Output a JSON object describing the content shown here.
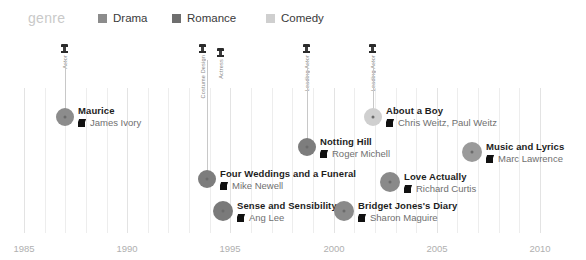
{
  "legend": {
    "title": "genre",
    "items": [
      {
        "label": "Drama",
        "color": "#8c8c8c",
        "x": 98
      },
      {
        "label": "Romance",
        "color": "#6e6e6e",
        "x": 172
      },
      {
        "label": "Comedy",
        "color": "#cfcfcf",
        "x": 266
      }
    ]
  },
  "axis": {
    "ticks": [
      "1985",
      "1990",
      "1995",
      "2000",
      "2005",
      "2010"
    ],
    "tick_x": [
      24,
      127,
      230,
      334,
      437,
      540
    ],
    "range_start": 1985,
    "range_end": 2010
  },
  "chart_data": {
    "type": "scatter",
    "title": "",
    "xlabel": "",
    "ylabel": "",
    "xlim": [
      1985,
      2010
    ],
    "grid": true,
    "legend_position": "top",
    "categories": [
      "Drama",
      "Romance",
      "Comedy"
    ],
    "points": [
      {
        "title": "Maurice",
        "director": "James Ivory",
        "year": 1987,
        "genre": "Drama",
        "color": "#8c8c8c",
        "cx": 65,
        "cy": 117,
        "r": 9,
        "leader_top": 60,
        "label_x": 78,
        "label_y": 105
      },
      {
        "title": "About a Boy",
        "director": "Chris Weitz, Paul Weitz",
        "year": 2002,
        "genre": "Comedy",
        "color": "#cfcfcf",
        "cx": 373,
        "cy": 117,
        "r": 9,
        "leader_top": 60,
        "label_x": 386,
        "label_y": 105
      },
      {
        "title": "Notting Hill",
        "director": "Roger Michell",
        "year": 1999,
        "genre": "Romance",
        "color": "#7d7d7d",
        "cx": 307,
        "cy": 147,
        "r": 9,
        "leader_top": 60,
        "label_x": 320,
        "label_y": 136
      },
      {
        "title": "Music and Lyrics",
        "director": "Marc Lawrence",
        "year": 2007,
        "genre": "Comedy",
        "color": "#9a9a9a",
        "cx": 472,
        "cy": 152,
        "r": 10,
        "leader_top": 152,
        "label_x": 486,
        "label_y": 141
      },
      {
        "title": "Four Weddings and a Funeral",
        "director": "Mike Newell",
        "year": 1994,
        "genre": "Romance",
        "color": "#7d7d7d",
        "cx": 207,
        "cy": 179,
        "r": 9,
        "leader_top": 60,
        "label_x": 220,
        "label_y": 168
      },
      {
        "title": "Love Actually",
        "director": "Richard Curtis",
        "year": 2003,
        "genre": "Romance",
        "color": "#8a8a8a",
        "cx": 390,
        "cy": 182,
        "r": 10,
        "leader_top": 182,
        "label_x": 404,
        "label_y": 171
      },
      {
        "title": "Sense and Sensibility",
        "director": "Ang Lee",
        "year": 1995,
        "genre": "Romance",
        "color": "#7a7a7a",
        "cx": 223,
        "cy": 211,
        "r": 10,
        "leader_top": 211,
        "label_x": 237,
        "label_y": 200
      },
      {
        "title": "Bridget Jones's Diary",
        "director": "Sharon Maguire",
        "year": 2001,
        "genre": "Romance",
        "color": "#8a8a8a",
        "cx": 344,
        "cy": 211,
        "r": 10,
        "leader_top": 211,
        "label_x": 358,
        "label_y": 200
      }
    ],
    "annotations": [
      {
        "text": "Actor",
        "x": 65,
        "y": 44,
        "icon": "award-icon"
      },
      {
        "text": "Costume Design",
        "x": 203,
        "y": 44,
        "icon": "award-icon"
      },
      {
        "text": "Actress",
        "x": 221,
        "y": 48,
        "icon": "award-icon"
      },
      {
        "text": "Leading Actor",
        "x": 307,
        "y": 44,
        "icon": "award-icon"
      },
      {
        "text": "Leading Actor",
        "x": 373,
        "y": 44,
        "icon": "award-icon"
      }
    ]
  }
}
